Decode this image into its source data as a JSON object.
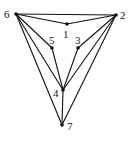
{
  "diagram": {
    "type": "graph",
    "nodes": [
      {
        "id": "1",
        "label": "1",
        "x": 67,
        "y": 24,
        "lx": 63,
        "ly": 38
      },
      {
        "id": "2",
        "label": "2",
        "x": 116,
        "y": 15,
        "lx": 120,
        "ly": 19
      },
      {
        "id": "3",
        "label": "3",
        "x": 78,
        "y": 48,
        "lx": 75,
        "ly": 44
      },
      {
        "id": "4",
        "label": "4",
        "x": 63,
        "y": 90,
        "lx": 53,
        "ly": 97
      },
      {
        "id": "5",
        "label": "5",
        "x": 52,
        "y": 48,
        "lx": 49,
        "ly": 44
      },
      {
        "id": "6",
        "label": "6",
        "x": 16,
        "y": 14,
        "lx": 4,
        "ly": 18
      },
      {
        "id": "7",
        "label": "7",
        "x": 62,
        "y": 125,
        "lx": 67,
        "ly": 130
      }
    ],
    "edges": [
      [
        "6",
        "2"
      ],
      [
        "6",
        "1"
      ],
      [
        "1",
        "2"
      ],
      [
        "6",
        "5"
      ],
      [
        "5",
        "4"
      ],
      [
        "6",
        "4"
      ],
      [
        "6",
        "7"
      ],
      [
        "2",
        "3"
      ],
      [
        "3",
        "4"
      ],
      [
        "2",
        "4"
      ],
      [
        "2",
        "7"
      ],
      [
        "4",
        "7"
      ]
    ],
    "colors": {
      "stroke": "#111111",
      "background": "#ffffff"
    }
  }
}
